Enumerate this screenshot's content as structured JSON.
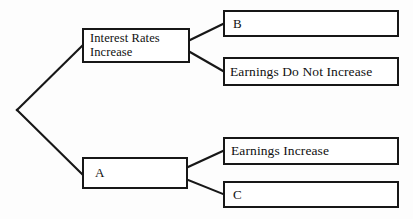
{
  "diagram": {
    "type": "decision-tree",
    "title": "",
    "background_color": "#fdfdfd",
    "line_color": "#171717",
    "box_border_color": "#171717",
    "box_fill_color": "#ffffff",
    "root": {
      "label": "",
      "x": 17,
      "y": 110
    },
    "nodes": [
      {
        "id": "interest-rates-increase",
        "label": "Interest Rates\nIncrease",
        "x": 82,
        "y": 28,
        "width": 108,
        "height": 35
      },
      {
        "id": "a",
        "label": "A",
        "x": 82,
        "y": 157,
        "width": 106,
        "height": 32
      },
      {
        "id": "b",
        "label": "B",
        "x": 223,
        "y": 10,
        "width": 176,
        "height": 27
      },
      {
        "id": "earnings-do-not-increase",
        "label": "Earnings Do Not Increase",
        "x": 223,
        "y": 57,
        "width": 176,
        "height": 29
      },
      {
        "id": "earnings-increase",
        "label": "Earnings Increase",
        "x": 223,
        "y": 137,
        "width": 176,
        "height": 28
      },
      {
        "id": "c",
        "label": "C",
        "x": 223,
        "y": 181,
        "width": 176,
        "height": 27
      }
    ],
    "edges": [
      {
        "id": "root-to-interest-rates",
        "from": "root",
        "to": "interest-rates-increase",
        "x1": 17,
        "y1": 110,
        "x2": 82,
        "y2": 46
      },
      {
        "id": "root-to-a",
        "from": "root",
        "to": "a",
        "x1": 17,
        "y1": 110,
        "x2": 82,
        "y2": 174
      },
      {
        "id": "interest-rates-to-b",
        "from": "interest-rates-increase",
        "to": "b",
        "x1": 190,
        "y1": 40,
        "x2": 223,
        "y2": 24
      },
      {
        "id": "interest-rates-to-earnings-do-not-increase",
        "from": "interest-rates-increase",
        "to": "earnings-do-not-increase",
        "x1": 190,
        "y1": 52,
        "x2": 223,
        "y2": 71
      },
      {
        "id": "a-to-earnings-increase",
        "from": "a",
        "to": "earnings-increase",
        "x1": 188,
        "y1": 167,
        "x2": 223,
        "y2": 151
      },
      {
        "id": "a-to-c",
        "from": "a",
        "to": "c",
        "x1": 188,
        "y1": 180,
        "x2": 223,
        "y2": 194
      }
    ]
  }
}
